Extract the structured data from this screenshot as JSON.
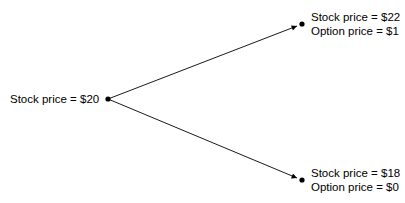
{
  "diagram": {
    "type": "binomial-tree",
    "root": {
      "stock_label": "Stock price = $20"
    },
    "up": {
      "stock_label": "Stock price = $22",
      "option_label": "Option price = $1"
    },
    "down": {
      "stock_label": "Stock price = $18",
      "option_label": "Option price = $0"
    },
    "colors": {
      "line": "#000000",
      "background": "#ffffff"
    }
  }
}
